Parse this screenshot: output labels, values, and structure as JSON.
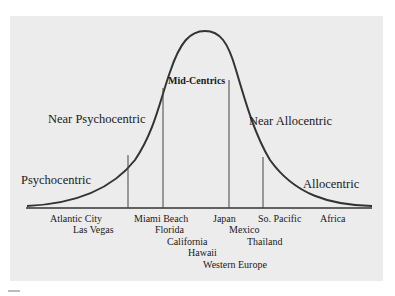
{
  "diagram": {
    "type": "bell-curve",
    "segments": [
      {
        "label": "Psychocentric"
      },
      {
        "label": "Near Psychocentric"
      },
      {
        "label": "Mid-Centrics"
      },
      {
        "label": "Near Allocentric"
      },
      {
        "label": "Allocentric"
      }
    ],
    "destinations": [
      {
        "label": "Atlantic City"
      },
      {
        "label": "Las Vegas"
      },
      {
        "label": "Miami Beach"
      },
      {
        "label": "Florida"
      },
      {
        "label": "California"
      },
      {
        "label": "Hawaii"
      },
      {
        "label": "Western Europe"
      },
      {
        "label": "Japan"
      },
      {
        "label": "Mexico"
      },
      {
        "label": "Thailand"
      },
      {
        "label": "So. Pacific"
      },
      {
        "label": "Africa"
      }
    ],
    "colors": {
      "background": "#ececec",
      "line": "#333333",
      "text": "#1a1a1a"
    }
  }
}
